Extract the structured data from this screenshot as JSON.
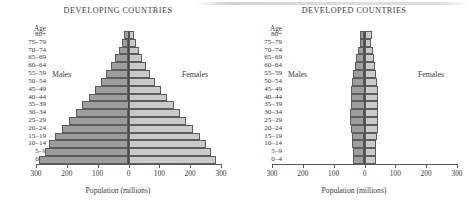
{
  "figure": {
    "axis_caption": "Population (millions)",
    "age_header": "Age",
    "males_label": "Males",
    "females_label": "Females",
    "tick_labels": [
      "300",
      "200",
      "100",
      "0",
      "100",
      "200",
      "300"
    ],
    "male_color": "#9d9d9d",
    "female_color": "#cacaca",
    "outline_color": "#5d5d5d"
  },
  "chart_data": [
    {
      "type": "bar",
      "title": "DEVELOPING COUNTRIES",
      "subtype": "population-pyramid",
      "xlabel": "Population (millions)",
      "ylabel": "Age",
      "xlim": [
        -300,
        300
      ],
      "xticks": [
        -300,
        -200,
        -100,
        0,
        100,
        200,
        300
      ],
      "xticklabels": [
        "300",
        "200",
        "100",
        "0",
        "100",
        "200",
        "300"
      ],
      "grid": false,
      "legend": [
        "Males",
        "Females"
      ],
      "legend_position": "inside-left-and-right",
      "categories": [
        "0-4",
        "5-9",
        "10-14",
        "15-19",
        "20-24",
        "25-29",
        "30-34",
        "35-39",
        "40-44",
        "45-49",
        "50-54",
        "55-59",
        "60-64",
        "65-69",
        "70-74",
        "75-79",
        "80+"
      ],
      "series": [
        {
          "name": "Males",
          "side": "left",
          "values": [
            290,
            272,
            258,
            238,
            215,
            193,
            170,
            150,
            128,
            108,
            88,
            72,
            57,
            43,
            32,
            22,
            15
          ]
        },
        {
          "name": "Females",
          "side": "right",
          "values": [
            285,
            268,
            252,
            232,
            210,
            188,
            166,
            146,
            126,
            106,
            87,
            71,
            57,
            44,
            33,
            24,
            18
          ]
        }
      ]
    },
    {
      "type": "bar",
      "title": "DEVELOPED COUNTRIES",
      "subtype": "population-pyramid",
      "xlabel": "Population (millions)",
      "ylabel": "Age",
      "xlim": [
        -300,
        300
      ],
      "xticks": [
        -300,
        -200,
        -100,
        0,
        100,
        200,
        300
      ],
      "xticklabels": [
        "300",
        "200",
        "100",
        "0",
        "100",
        "200",
        "300"
      ],
      "grid": false,
      "legend": [
        "Males",
        "Females"
      ],
      "legend_position": "inside-left-and-right",
      "categories": [
        "0-4",
        "5-9",
        "10-14",
        "15-19",
        "20-24",
        "25-29",
        "30-34",
        "35-39",
        "40-44",
        "45-49",
        "50-54",
        "55-59",
        "60-64",
        "65-69",
        "70-74",
        "75-79",
        "80+"
      ],
      "series": [
        {
          "name": "Males",
          "side": "left",
          "values": [
            38,
            38,
            40,
            42,
            45,
            46,
            46,
            45,
            44,
            45,
            40,
            36,
            32,
            28,
            22,
            16,
            13
          ]
        },
        {
          "name": "Females",
          "side": "right",
          "values": [
            36,
            36,
            38,
            40,
            43,
            45,
            45,
            45,
            44,
            45,
            41,
            38,
            34,
            31,
            26,
            21,
            24
          ]
        }
      ]
    }
  ]
}
